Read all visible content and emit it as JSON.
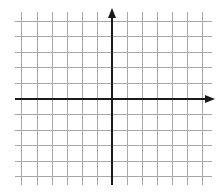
{
  "diagram": {
    "type": "coordinate-plane",
    "grid": {
      "vertical_x": [
        21,
        37,
        52,
        67,
        82,
        97,
        127,
        142,
        157,
        172,
        187,
        202
      ],
      "horizontal_y": [
        21,
        36,
        52,
        67,
        83,
        114,
        130,
        145,
        161,
        176
      ],
      "x_extent": [
        15,
        212
      ],
      "y_extent": [
        12,
        185
      ],
      "color": "#a8a8a8"
    },
    "axes": {
      "x_axis": {
        "y": 99,
        "x_start": 15,
        "x_end": 215,
        "arrow": "right"
      },
      "y_axis": {
        "x": 112,
        "y_start": 185,
        "y_end": 8,
        "arrow": "up"
      },
      "color": "#1a1a1a"
    }
  }
}
